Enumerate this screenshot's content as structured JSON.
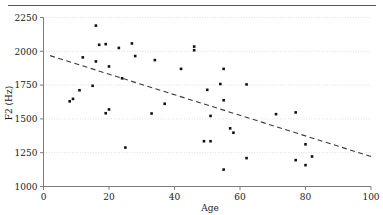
{
  "figure": {
    "has_top_rule": true,
    "caption_fragment": ""
  },
  "chart_data": {
    "type": "scatter",
    "title": "",
    "xlabel": "Age",
    "ylabel": "F2 (Hz)",
    "xlim": [
      0,
      100
    ],
    "ylim": [
      1000,
      2250
    ],
    "xticks": [
      0,
      20,
      40,
      60,
      80,
      100
    ],
    "yticks": [
      1000,
      1250,
      1500,
      1750,
      2000,
      2250
    ],
    "xticklabels": [
      "0",
      "20",
      "40",
      "60",
      "80",
      "100"
    ],
    "yticklabels": [
      "1000",
      "1250",
      "1500",
      "1750",
      "2000",
      "2250"
    ],
    "grid": "horizontal-dotted",
    "legend": null,
    "marker": "filled-square",
    "marker_color": "#111111",
    "points": [
      {
        "x": 8,
        "y": 1630
      },
      {
        "x": 9,
        "y": 1648
      },
      {
        "x": 11,
        "y": 1712
      },
      {
        "x": 12,
        "y": 1955
      },
      {
        "x": 15,
        "y": 1745
      },
      {
        "x": 16,
        "y": 2190
      },
      {
        "x": 16,
        "y": 1925
      },
      {
        "x": 17,
        "y": 2048
      },
      {
        "x": 19,
        "y": 2053
      },
      {
        "x": 19,
        "y": 1542
      },
      {
        "x": 20,
        "y": 1888
      },
      {
        "x": 20,
        "y": 1570
      },
      {
        "x": 23,
        "y": 2025
      },
      {
        "x": 24,
        "y": 1800
      },
      {
        "x": 25,
        "y": 1288
      },
      {
        "x": 27,
        "y": 2058
      },
      {
        "x": 28,
        "y": 1965
      },
      {
        "x": 33,
        "y": 1540
      },
      {
        "x": 34,
        "y": 1935
      },
      {
        "x": 37,
        "y": 1612
      },
      {
        "x": 42,
        "y": 1870
      },
      {
        "x": 46,
        "y": 2008
      },
      {
        "x": 46,
        "y": 2035
      },
      {
        "x": 49,
        "y": 1335
      },
      {
        "x": 50,
        "y": 1715
      },
      {
        "x": 51,
        "y": 1335
      },
      {
        "x": 51,
        "y": 1522
      },
      {
        "x": 54,
        "y": 1758
      },
      {
        "x": 55,
        "y": 1870
      },
      {
        "x": 55,
        "y": 1638
      },
      {
        "x": 55,
        "y": 1125
      },
      {
        "x": 57,
        "y": 1430
      },
      {
        "x": 58,
        "y": 1398
      },
      {
        "x": 62,
        "y": 1755
      },
      {
        "x": 62,
        "y": 1210
      },
      {
        "x": 71,
        "y": 1535
      },
      {
        "x": 77,
        "y": 1548
      },
      {
        "x": 77,
        "y": 1195
      },
      {
        "x": 80,
        "y": 1312
      },
      {
        "x": 80,
        "y": 1158
      },
      {
        "x": 82,
        "y": 1222
      }
    ],
    "trendline": {
      "style": "dashed",
      "x_start": 2,
      "y_start": 1968,
      "x_end": 100,
      "y_end": 1222
    }
  }
}
